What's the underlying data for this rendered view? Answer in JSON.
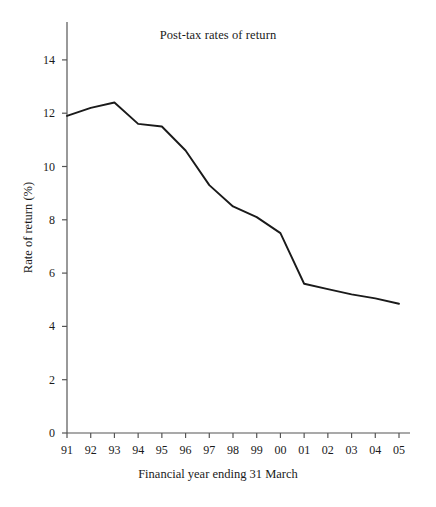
{
  "chart_data": {
    "type": "line",
    "title": "Post-tax rates of return",
    "xlabel": "Financial year ending 31 March",
    "ylabel": "Rate of return (%)",
    "categories": [
      "91",
      "92",
      "93",
      "94",
      "95",
      "96",
      "97",
      "98",
      "99",
      "00",
      "01",
      "02",
      "03",
      "04",
      "05"
    ],
    "values": [
      11.9,
      12.2,
      12.4,
      11.6,
      11.5,
      10.6,
      9.3,
      8.5,
      8.1,
      7.5,
      5.6,
      5.4,
      5.2,
      5.05,
      4.85
    ],
    "series": [
      {
        "name": "Post-tax rate of return",
        "values": [
          11.9,
          12.2,
          12.4,
          11.6,
          11.5,
          10.6,
          9.3,
          8.5,
          8.1,
          7.5,
          5.6,
          5.4,
          5.2,
          5.05,
          4.85
        ]
      }
    ],
    "ylim": [
      0,
      15
    ],
    "y_ticks": [
      0,
      2,
      4,
      6,
      8,
      10,
      12,
      14
    ],
    "y_tick_labels": [
      "0",
      "2",
      "4",
      "6",
      "8",
      "10",
      "12",
      "14"
    ],
    "x_tick_labels": [
      "91",
      "92",
      "93",
      "94",
      "95",
      "96",
      "97",
      "98",
      "99",
      "00",
      "01",
      "02",
      "03",
      "04",
      "05"
    ],
    "grid": false,
    "legend": null,
    "line_color": "#1a1a1a",
    "axis_color": "#555555",
    "background_color": "#ffffff"
  }
}
